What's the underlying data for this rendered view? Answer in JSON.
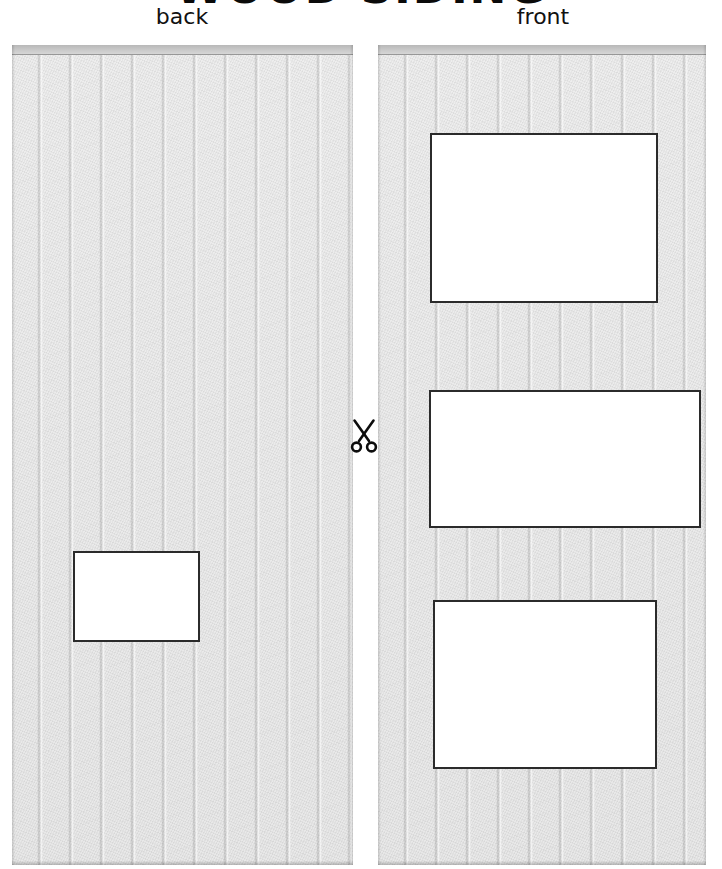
{
  "page": {
    "title": "WOOD SIDING",
    "background_color": "#ffffff",
    "width": 722,
    "height": 869
  },
  "colors": {
    "siding_base": "#e9e9e9",
    "siding_cap": "#c9c9c9",
    "groove_line": "#bfbfbf",
    "cutout_fill": "#ffffff",
    "cutout_border": "#2b2b2b",
    "text": "#111111"
  },
  "panels": [
    {
      "id": "back",
      "label": "back",
      "material": "vertical board wood siding",
      "board_count": 11,
      "cutouts": [
        {
          "name": "window-opening",
          "shape": "rectangle"
        }
      ]
    },
    {
      "id": "front",
      "label": "front",
      "material": "vertical board wood siding",
      "board_count": 11,
      "cutouts": [
        {
          "name": "upper-window-opening",
          "shape": "rectangle"
        },
        {
          "name": "middle-door-opening",
          "shape": "rectangle"
        },
        {
          "name": "lower-window-opening",
          "shape": "rectangle"
        }
      ]
    }
  ],
  "markers": {
    "cut_line": {
      "icon": "scissors-icon",
      "meaning": "cut here"
    }
  }
}
